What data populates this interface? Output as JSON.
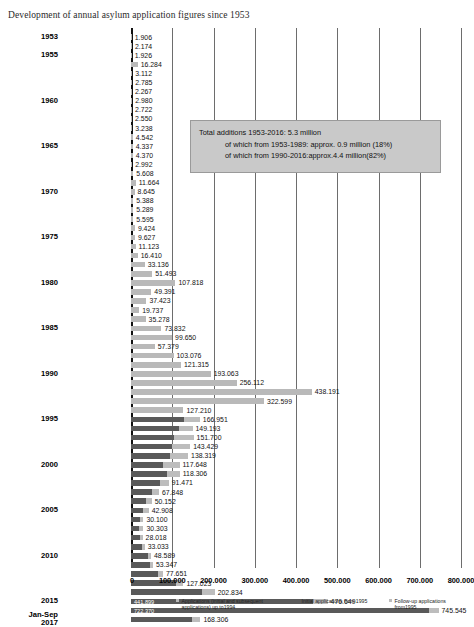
{
  "title": "Development of annual asylum application figures since 1953",
  "infobox": {
    "line1": "Total additions 1953-2016: 5.3 million",
    "line2": "of which from 1953-1989: approx. 0.9 million (18%)",
    "line3": "of which from 1990-2016:approx.4.4 million(82%)"
  },
  "legend": [
    {
      "label": "Applications (initial and subsequent applications) up to1994",
      "color": "#b9b9b9",
      "name": "legend-applications-up-to-1994"
    },
    {
      "label": "Initial applications from 1995",
      "color": "#595959",
      "name": "legend-initial-applications-from-1995"
    },
    {
      "label": "Follow-up applications from1995",
      "color": "#bdbdbd",
      "name": "legend-follow-up-applications-from-1995"
    }
  ],
  "colors": {
    "old_combined": "#b9b9b9",
    "initial": "#595959",
    "follow_up": "#bdbdbd",
    "infobox_bg": "#c9c9c9",
    "gridline": "#6d6d6d",
    "axis": "#111111"
  },
  "chart_data": {
    "type": "bar",
    "orientation": "horizontal",
    "title": "Development of annual asylum application figures since 1953",
    "xlabel": "",
    "ylabel": "",
    "xlim": [
      0,
      800000
    ],
    "xticks": [
      0,
      100000,
      200000,
      300000,
      400000,
      500000,
      600000,
      700000,
      800000
    ],
    "xtick_labels": [
      "0",
      "100.000",
      "200.000",
      "300.000",
      "400.000",
      "500.000",
      "600.000",
      "700.000",
      "800.000"
    ],
    "grid": true,
    "legend_position": "bottom",
    "series": [
      {
        "name": "Applications (initial and subsequent applications) up to1994",
        "color": "#b9b9b9"
      },
      {
        "name": "Initial applications from 1995",
        "color": "#595959"
      },
      {
        "name": "Follow-up applications from1995",
        "color": "#bdbdbd"
      }
    ],
    "categories": [
      "1953",
      "1954",
      "1955",
      "1956",
      "1957",
      "1958",
      "1959",
      "1960",
      "1961",
      "1962",
      "1963",
      "1964",
      "1965",
      "1966",
      "1967",
      "1968",
      "1969",
      "1970",
      "1971",
      "1972",
      "1973",
      "1974",
      "1975",
      "1976",
      "1977",
      "1978",
      "1979",
      "1980",
      "1981",
      "1982",
      "1983",
      "1984",
      "1985",
      "1986",
      "1987",
      "1988",
      "1989",
      "1990",
      "1991",
      "1992",
      "1993",
      "1994",
      "1995",
      "1996",
      "1997",
      "1998",
      "1999",
      "2000",
      "2001",
      "2002",
      "2003",
      "2004",
      "2005",
      "2006",
      "2007",
      "2008",
      "2009",
      "2010",
      "2011",
      "2012",
      "2013",
      "2014",
      "2015",
      "2016",
      "Jan-Sep 2017"
    ],
    "rows": [
      {
        "year": "1953",
        "axis_label": "1953",
        "total": 1906,
        "initial": null,
        "follow_up": null,
        "label": "1.906"
      },
      {
        "year": "1954",
        "axis_label": "",
        "total": 2174,
        "initial": null,
        "follow_up": null,
        "label": "2.174"
      },
      {
        "year": "1955",
        "axis_label": "1955",
        "total": 1926,
        "initial": null,
        "follow_up": null,
        "label": "1.926"
      },
      {
        "year": "1956",
        "axis_label": "",
        "total": 16284,
        "initial": null,
        "follow_up": null,
        "label": "16.284"
      },
      {
        "year": "1957",
        "axis_label": "",
        "total": 3112,
        "initial": null,
        "follow_up": null,
        "label": "3.112"
      },
      {
        "year": "1958",
        "axis_label": "",
        "total": 2785,
        "initial": null,
        "follow_up": null,
        "label": "2.785"
      },
      {
        "year": "1959",
        "axis_label": "",
        "total": 2267,
        "initial": null,
        "follow_up": null,
        "label": "2.267"
      },
      {
        "year": "1960",
        "axis_label": "1960",
        "total": 2980,
        "initial": null,
        "follow_up": null,
        "label": "2.980"
      },
      {
        "year": "1961",
        "axis_label": "",
        "total": 2722,
        "initial": null,
        "follow_up": null,
        "label": "2.722"
      },
      {
        "year": "1962",
        "axis_label": "",
        "total": 2550,
        "initial": null,
        "follow_up": null,
        "label": "2.550"
      },
      {
        "year": "1963",
        "axis_label": "",
        "total": 3238,
        "initial": null,
        "follow_up": null,
        "label": "3.238"
      },
      {
        "year": "1964",
        "axis_label": "",
        "total": 4542,
        "initial": null,
        "follow_up": null,
        "label": "4.542"
      },
      {
        "year": "1965",
        "axis_label": "1965",
        "total": 4337,
        "initial": null,
        "follow_up": null,
        "label": "4.337"
      },
      {
        "year": "1966",
        "axis_label": "",
        "total": 4370,
        "initial": null,
        "follow_up": null,
        "label": "4.370"
      },
      {
        "year": "1967",
        "axis_label": "",
        "total": 2992,
        "initial": null,
        "follow_up": null,
        "label": "2.992"
      },
      {
        "year": "1968",
        "axis_label": "",
        "total": 5608,
        "initial": null,
        "follow_up": null,
        "label": "5.608"
      },
      {
        "year": "1969",
        "axis_label": "",
        "total": 11664,
        "initial": null,
        "follow_up": null,
        "label": "11.664"
      },
      {
        "year": "1970",
        "axis_label": "1970",
        "total": 8645,
        "initial": null,
        "follow_up": null,
        "label": "8.645"
      },
      {
        "year": "1971",
        "axis_label": "",
        "total": 5388,
        "initial": null,
        "follow_up": null,
        "label": "5.388"
      },
      {
        "year": "1972",
        "axis_label": "",
        "total": 5289,
        "initial": null,
        "follow_up": null,
        "label": "5.289"
      },
      {
        "year": "1973",
        "axis_label": "",
        "total": 5595,
        "initial": null,
        "follow_up": null,
        "label": "5.595"
      },
      {
        "year": "1974",
        "axis_label": "",
        "total": 9424,
        "initial": null,
        "follow_up": null,
        "label": "9.424"
      },
      {
        "year": "1975",
        "axis_label": "1975",
        "total": 9627,
        "initial": null,
        "follow_up": null,
        "label": "9.627"
      },
      {
        "year": "1976",
        "axis_label": "",
        "total": 11123,
        "initial": null,
        "follow_up": null,
        "label": "11.123"
      },
      {
        "year": "1977",
        "axis_label": "",
        "total": 16410,
        "initial": null,
        "follow_up": null,
        "label": "16.410"
      },
      {
        "year": "1978",
        "axis_label": "",
        "total": 33136,
        "initial": null,
        "follow_up": null,
        "label": "33.136"
      },
      {
        "year": "1979",
        "axis_label": "",
        "total": 51493,
        "initial": null,
        "follow_up": null,
        "label": "51.493"
      },
      {
        "year": "1980",
        "axis_label": "1980",
        "total": 107818,
        "initial": null,
        "follow_up": null,
        "label": "107.818"
      },
      {
        "year": "1981",
        "axis_label": "",
        "total": 49391,
        "initial": null,
        "follow_up": null,
        "label": "49.391"
      },
      {
        "year": "1982",
        "axis_label": "",
        "total": 37423,
        "initial": null,
        "follow_up": null,
        "label": "37.423"
      },
      {
        "year": "1983",
        "axis_label": "",
        "total": 19737,
        "initial": null,
        "follow_up": null,
        "label": "19.737"
      },
      {
        "year": "1984",
        "axis_label": "",
        "total": 35278,
        "initial": null,
        "follow_up": null,
        "label": "35.278"
      },
      {
        "year": "1985",
        "axis_label": "1985",
        "total": 73832,
        "initial": null,
        "follow_up": null,
        "label": "73.832"
      },
      {
        "year": "1986",
        "axis_label": "",
        "total": 99650,
        "initial": null,
        "follow_up": null,
        "label": "99.650"
      },
      {
        "year": "1987",
        "axis_label": "",
        "total": 57379,
        "initial": null,
        "follow_up": null,
        "label": "57.379"
      },
      {
        "year": "1988",
        "axis_label": "",
        "total": 103076,
        "initial": null,
        "follow_up": null,
        "label": "103.076"
      },
      {
        "year": "1989",
        "axis_label": "",
        "total": 121315,
        "initial": null,
        "follow_up": null,
        "label": "121.315"
      },
      {
        "year": "1990",
        "axis_label": "1990",
        "total": 193063,
        "initial": null,
        "follow_up": null,
        "label": "193.063"
      },
      {
        "year": "1991",
        "axis_label": "",
        "total": 256112,
        "initial": null,
        "follow_up": null,
        "label": "256.112"
      },
      {
        "year": "1992",
        "axis_label": "",
        "total": 438191,
        "initial": null,
        "follow_up": null,
        "label": "438.191"
      },
      {
        "year": "1993",
        "axis_label": "",
        "total": 322599,
        "initial": null,
        "follow_up": null,
        "label": "322.599"
      },
      {
        "year": "1994",
        "axis_label": "",
        "total": 127210,
        "initial": null,
        "follow_up": null,
        "label": "127.210"
      },
      {
        "year": "1995",
        "axis_label": "1995",
        "total": 166951,
        "initial": 127937,
        "follow_up": 39014,
        "label": "166.951"
      },
      {
        "year": "1996",
        "axis_label": "",
        "total": 149193,
        "initial": 116367,
        "follow_up": 32826,
        "label": "149.193"
      },
      {
        "year": "1997",
        "axis_label": "",
        "total": 151700,
        "initial": 104353,
        "follow_up": 47347,
        "label": "151.700"
      },
      {
        "year": "1998",
        "axis_label": "",
        "total": 143429,
        "initial": 98644,
        "follow_up": 44785,
        "label": "143.429"
      },
      {
        "year": "1999",
        "axis_label": "",
        "total": 138319,
        "initial": 95113,
        "follow_up": 43206,
        "label": "138.319"
      },
      {
        "year": "2000",
        "axis_label": "2000",
        "total": 117648,
        "initial": 78564,
        "follow_up": 39084,
        "label": "117.648"
      },
      {
        "year": "2001",
        "axis_label": "",
        "total": 118306,
        "initial": 88287,
        "follow_up": 30019,
        "label": "118.306"
      },
      {
        "year": "2002",
        "axis_label": "",
        "total": 91471,
        "initial": 71127,
        "follow_up": 20344,
        "label": "91.471"
      },
      {
        "year": "2003",
        "axis_label": "",
        "total": 67848,
        "initial": 50563,
        "follow_up": 17285,
        "label": "67.848"
      },
      {
        "year": "2004",
        "axis_label": "",
        "total": 50152,
        "initial": 35607,
        "follow_up": 14545,
        "label": "50.152"
      },
      {
        "year": "2005",
        "axis_label": "2005",
        "total": 42908,
        "initial": 28914,
        "follow_up": 13994,
        "label": "42.908"
      },
      {
        "year": "2006",
        "axis_label": "",
        "total": 30100,
        "initial": 21029,
        "follow_up": 9071,
        "label": "30.100"
      },
      {
        "year": "2007",
        "axis_label": "",
        "total": 30303,
        "initial": 19164,
        "follow_up": 11139,
        "label": "30.303"
      },
      {
        "year": "2008",
        "axis_label": "",
        "total": 28018,
        "initial": 22085,
        "follow_up": 5933,
        "label": "28.018"
      },
      {
        "year": "2009",
        "axis_label": "",
        "total": 33033,
        "initial": 27649,
        "follow_up": 5384,
        "label": "33.033"
      },
      {
        "year": "2010",
        "axis_label": "2010",
        "total": 48589,
        "initial": 41332,
        "follow_up": 7257,
        "label": "48.589"
      },
      {
        "year": "2011",
        "axis_label": "",
        "total": 53347,
        "initial": 45741,
        "follow_up": 7606,
        "label": "53.347"
      },
      {
        "year": "2012",
        "axis_label": "",
        "total": 77651,
        "initial": 64539,
        "follow_up": 13112,
        "label": "77.651"
      },
      {
        "year": "2013",
        "axis_label": "",
        "total": 127023,
        "initial": 109580,
        "follow_up": 17443,
        "label": "127.023"
      },
      {
        "year": "2014",
        "axis_label": "",
        "total": 202834,
        "initial": 173072,
        "follow_up": 29762,
        "label": "202.834"
      },
      {
        "year": "2015",
        "axis_label": "2015",
        "total": 476649,
        "initial": 441899,
        "follow_up": 34750,
        "label": "476.649",
        "inside_label": "441.899"
      },
      {
        "year": "2016",
        "axis_label": "",
        "total": 745545,
        "initial": 722370,
        "follow_up": 23175,
        "label": "745.545",
        "inside_label": "722.370"
      },
      {
        "year": "Jan-Sep 2017",
        "axis_label": "Jan-Sep\n2017",
        "total": 168306,
        "initial": 148090,
        "follow_up": 20216,
        "label": "168.306"
      }
    ]
  }
}
